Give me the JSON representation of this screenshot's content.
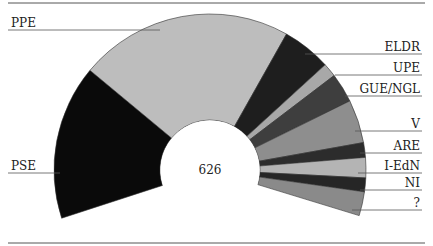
{
  "chart_data": {
    "type": "pie",
    "subtype": "semicircular-donut",
    "title": "",
    "center_label": "626",
    "total": 626,
    "categories": [
      "PSE",
      "PPE",
      "ELDR",
      "UPE",
      "GUE/NGL",
      "V",
      "ARE",
      "I-EdN",
      "NI",
      "?"
    ],
    "values": [
      168,
      232,
      53,
      15,
      32,
      47,
      16,
      22,
      15,
      26
    ],
    "colors": [
      "#0a0a0a",
      "#bdbdbd",
      "#1e1e1e",
      "#a8a8a8",
      "#3e3e3e",
      "#8e8e8e",
      "#2c2c2c",
      "#b4b4b4",
      "#262626",
      "#8a8a8a"
    ],
    "start_angle_deg": 198,
    "end_angle_deg": -17,
    "legend_position": "leader-lines",
    "grid": false
  },
  "labels": {
    "center": "626",
    "parties": [
      "PSE",
      "PPE",
      "ELDR",
      "UPE",
      "GUE/NGL",
      "V",
      "ARE",
      "I-EdN",
      "NI",
      "?"
    ]
  }
}
